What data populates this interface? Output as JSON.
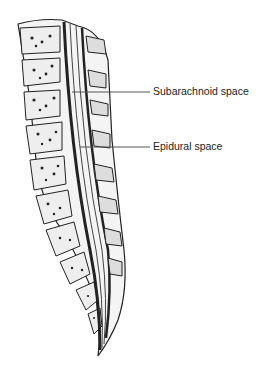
{
  "figure": {
    "labels": [
      {
        "text": "Subarachnoid space",
        "x": 153,
        "y": 86,
        "line_from": [
          72,
          92
        ],
        "line_to": [
          150,
          92
        ]
      },
      {
        "text": "Epidural space",
        "x": 153,
        "y": 141,
        "line_from": [
          80,
          147
        ],
        "line_to": [
          150,
          147
        ]
      }
    ]
  }
}
